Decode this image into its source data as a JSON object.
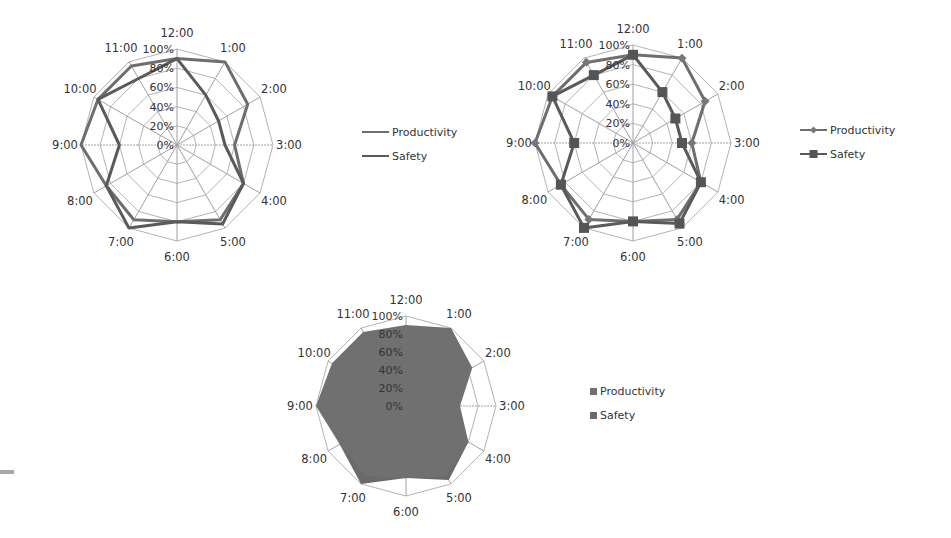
{
  "chart_data": [
    {
      "id": "radar-lines",
      "type": "radar",
      "variant": "lines",
      "title": "",
      "categories": [
        "12:00",
        "1:00",
        "2:00",
        "3:00",
        "4:00",
        "5:00",
        "6:00",
        "7:00",
        "8:00",
        "9:00",
        "10:00",
        "11:00"
      ],
      "series": [
        {
          "name": "Productivity",
          "values": [
            90,
            100,
            85,
            60,
            80,
            90,
            80,
            90,
            85,
            100,
            95,
            95
          ]
        },
        {
          "name": "Safety",
          "values": [
            90,
            60,
            50,
            50,
            80,
            95,
            80,
            100,
            85,
            60,
            95,
            80
          ]
        }
      ],
      "radial_ticks": [
        "0%",
        "20%",
        "40%",
        "60%",
        "80%",
        "100%"
      ],
      "rlim": [
        0,
        100
      ],
      "grid": true,
      "legend": {
        "position": "right",
        "marker": "line"
      },
      "layout": {
        "cx": 177,
        "cy": 145,
        "r": 96,
        "legend_x": 362,
        "legend_y": 132
      }
    },
    {
      "id": "radar-markers",
      "type": "radar",
      "variant": "lines-with-markers",
      "title": "",
      "categories": [
        "12:00",
        "1:00",
        "2:00",
        "3:00",
        "4:00",
        "5:00",
        "6:00",
        "7:00",
        "8:00",
        "9:00",
        "10:00",
        "11:00"
      ],
      "series": [
        {
          "name": "Productivity",
          "values": [
            90,
            100,
            85,
            60,
            80,
            90,
            80,
            90,
            85,
            100,
            95,
            95
          ],
          "marker": "diamond"
        },
        {
          "name": "Safety",
          "values": [
            90,
            60,
            50,
            50,
            80,
            95,
            80,
            100,
            85,
            60,
            95,
            80
          ],
          "marker": "square"
        }
      ],
      "radial_ticks": [
        "0%",
        "20%",
        "40%",
        "60%",
        "80%",
        "100%"
      ],
      "rlim": [
        0,
        100
      ],
      "grid": true,
      "legend": {
        "position": "right",
        "marker": "line-with-marker"
      },
      "layout": {
        "cx": 633,
        "cy": 143,
        "r": 98,
        "legend_x": 800,
        "legend_y": 130
      }
    },
    {
      "id": "radar-filled",
      "type": "radar",
      "variant": "filled",
      "title": "",
      "categories": [
        "12:00",
        "1:00",
        "2:00",
        "3:00",
        "4:00",
        "5:00",
        "6:00",
        "7:00",
        "8:00",
        "9:00",
        "10:00",
        "11:00"
      ],
      "series": [
        {
          "name": "Productivity",
          "values": [
            90,
            100,
            85,
            60,
            80,
            90,
            80,
            90,
            85,
            100,
            95,
            95
          ]
        },
        {
          "name": "Safety",
          "values": [
            90,
            60,
            50,
            50,
            80,
            95,
            80,
            100,
            85,
            60,
            95,
            80
          ]
        }
      ],
      "radial_ticks": [
        "0%",
        "20%",
        "40%",
        "60%",
        "80%",
        "100%"
      ],
      "rlim": [
        0,
        100
      ],
      "grid": true,
      "legend": {
        "position": "right",
        "marker": "square"
      },
      "layout": {
        "cx": 406,
        "cy": 406,
        "r": 90,
        "legend_x": 590,
        "legend_y": 392
      }
    }
  ],
  "colors": {
    "grid": "#b4b4b4",
    "axis": "#a0a0a0",
    "productivity": "#6e6e6e",
    "safety": "#5a5a5a",
    "fill_productivity": "#707070",
    "fill_safety": "#6a6a6a",
    "label": "#333333"
  }
}
